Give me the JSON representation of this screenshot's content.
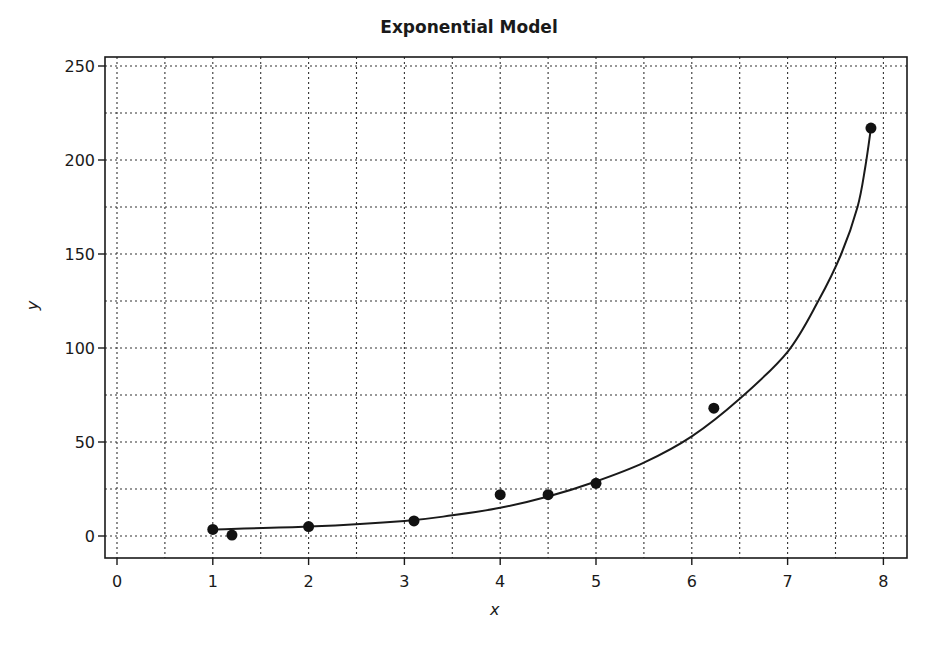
{
  "chart_data": {
    "type": "scatter",
    "title": "Exponential Model",
    "xlabel": "x",
    "ylabel": "y",
    "xlim": [
      -0.15,
      8.25
    ],
    "ylim": [
      -12,
      262
    ],
    "x_ticks": [
      0,
      1,
      2,
      3,
      4,
      5,
      6,
      7,
      8
    ],
    "y_ticks": [
      0,
      50,
      100,
      150,
      200,
      250
    ],
    "grid": {
      "on": true,
      "style": "dotted",
      "x_step": 0.5,
      "y_step": 25
    },
    "legend": null,
    "series": [
      {
        "name": "data",
        "kind": "scatter",
        "points": [
          {
            "x": 1.0,
            "y": 3.5
          },
          {
            "x": 1.2,
            "y": 0.5
          },
          {
            "x": 2.0,
            "y": 5
          },
          {
            "x": 3.1,
            "y": 8
          },
          {
            "x": 4.0,
            "y": 22
          },
          {
            "x": 4.5,
            "y": 22
          },
          {
            "x": 5.0,
            "y": 28
          },
          {
            "x": 6.23,
            "y": 68
          },
          {
            "x": 7.87,
            "y": 217
          }
        ]
      },
      {
        "name": "exponential fit",
        "kind": "line",
        "points": [
          {
            "x": 1.0,
            "y": 3.5
          },
          {
            "x": 2.0,
            "y": 5
          },
          {
            "x": 3.0,
            "y": 8
          },
          {
            "x": 3.5,
            "y": 11
          },
          {
            "x": 4.0,
            "y": 15
          },
          {
            "x": 4.5,
            "y": 21
          },
          {
            "x": 5.0,
            "y": 29
          },
          {
            "x": 5.5,
            "y": 39
          },
          {
            "x": 6.0,
            "y": 53
          },
          {
            "x": 6.5,
            "y": 73
          },
          {
            "x": 7.0,
            "y": 98
          },
          {
            "x": 7.32,
            "y": 125
          },
          {
            "x": 7.56,
            "y": 150
          },
          {
            "x": 7.73,
            "y": 175
          },
          {
            "x": 7.81,
            "y": 196
          },
          {
            "x": 7.87,
            "y": 217
          }
        ]
      }
    ]
  },
  "layout": {
    "plot_left_px": 105,
    "plot_right_px": 907,
    "plot_top_px": 57,
    "plot_bottom_px": 558,
    "x0_px": 117,
    "px_per_x": 95.8,
    "y0_px": 536,
    "px_per_y": 1.88
  }
}
